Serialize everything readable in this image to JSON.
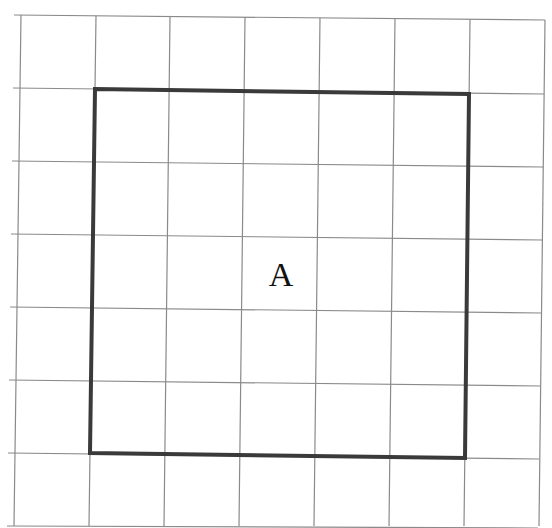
{
  "diagram": {
    "type": "grid-with-square",
    "grid": {
      "columns": 7,
      "rows": 7,
      "line_color": "#8a8a8a"
    },
    "square": {
      "label": "A",
      "from_cell": [
        1,
        1
      ],
      "to_cell": [
        6,
        6
      ],
      "side_in_cells": 5,
      "stroke_color": "#3a3a3a"
    }
  }
}
